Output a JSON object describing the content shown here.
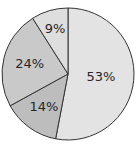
{
  "chart_data": {
    "type": "pie",
    "title": "",
    "slices": [
      {
        "label": "53%",
        "value": 53,
        "color": "#e3e3e3"
      },
      {
        "label": "14%",
        "value": 14,
        "color": "#bdbdbd"
      },
      {
        "label": "24%",
        "value": 24,
        "color": "#c9c9c9"
      },
      {
        "label": "9%",
        "value": 9,
        "color": "#dedede"
      }
    ],
    "start": "12 o'clock",
    "direction": "clockwise",
    "edge_color": "#333333",
    "legend": "none"
  }
}
